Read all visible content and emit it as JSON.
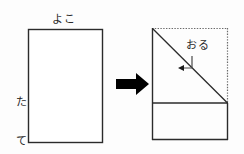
{
  "diagram": {
    "colors": {
      "stroke": "#2b2b2b",
      "dotted": "#6b6b6b",
      "arrow_fill": "#000000",
      "background": "#fdfdfd",
      "text": "#2a2a2a"
    },
    "left_figure": {
      "name": "original-rectangle",
      "label_top": "よこ",
      "label_top_meaning": "yoko (width)",
      "label_left": "たて",
      "label_left_chars": [
        "た",
        "て"
      ],
      "label_left_meaning": "tate (height)",
      "rect": {
        "x": 28,
        "y": 29,
        "width": 75,
        "height": 114
      }
    },
    "transform_arrow": {
      "name": "transform-arrow",
      "direction": "right",
      "glyph": "➡"
    },
    "right_figure": {
      "name": "folded-rectangle",
      "label_fold": "おる",
      "label_fold_meaning": "oru (fold)",
      "rect": {
        "x": 152,
        "y": 28,
        "width": 76,
        "height": 112
      },
      "fold_divider_y": 103,
      "diagonal": {
        "x1": 152,
        "y1": 28,
        "x2": 228,
        "y2": 103
      },
      "dotted_edges": [
        "top",
        "right-upper"
      ],
      "leader": {
        "from_x": 192,
        "from_y": 55,
        "corner_y": 68,
        "to_x": 179
      }
    }
  }
}
